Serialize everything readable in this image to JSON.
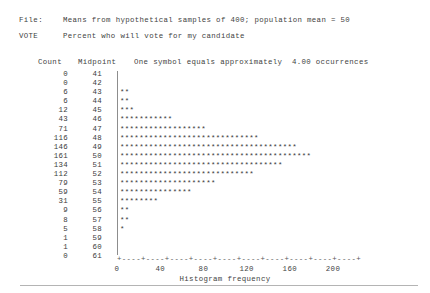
{
  "header": {
    "file_label": "File:",
    "file_value": "Means from hypothetical samples of 400; population mean = 50",
    "variable_label": "VOTE",
    "variable_value": "Percent who will vote for my candidate",
    "count_column_header": "Count",
    "midpoint_column_header": "Midpoint",
    "symbol_legend": "One symbol equals approximately  4.00 occurrences"
  },
  "axis": {
    "line": "+----+----+----+----+----+----+----+----+----+----+",
    "title": "Histogram frequency",
    "tick_labels": [
      "0",
      "40",
      "80",
      "120",
      "160",
      "200"
    ],
    "min": 0,
    "max": 200
  },
  "chart_data": {
    "type": "bar",
    "orientation": "horizontal",
    "title": "Means from hypothetical samples of 400; population mean = 50",
    "subtitle": "Percent who will vote for my candidate",
    "xlabel": "Histogram frequency",
    "ylabel": "Midpoint",
    "xlim": [
      0,
      200
    ],
    "symbol_scale": 4.0,
    "symbol_char": "*",
    "grid": false,
    "legend": "none",
    "categories": [
      41,
      42,
      43,
      44,
      45,
      46,
      47,
      48,
      49,
      50,
      51,
      52,
      53,
      54,
      55,
      56,
      57,
      58,
      59,
      60,
      61
    ],
    "values": [
      0,
      0,
      6,
      6,
      12,
      43,
      71,
      116,
      146,
      161,
      134,
      112,
      79,
      59,
      31,
      9,
      8,
      5,
      1,
      1,
      0
    ],
    "symbols": [
      0,
      0,
      2,
      2,
      3,
      11,
      18,
      29,
      37,
      40,
      34,
      28,
      20,
      15,
      8,
      2,
      2,
      1,
      0,
      0,
      0
    ]
  },
  "rows": [
    {
      "count": "0",
      "midpoint": "41",
      "bar": ""
    },
    {
      "count": "0",
      "midpoint": "42",
      "bar": ""
    },
    {
      "count": "6",
      "midpoint": "43",
      "bar": "**"
    },
    {
      "count": "6",
      "midpoint": "44",
      "bar": "**"
    },
    {
      "count": "12",
      "midpoint": "45",
      "bar": "***"
    },
    {
      "count": "43",
      "midpoint": "46",
      "bar": "***********"
    },
    {
      "count": "71",
      "midpoint": "47",
      "bar": "******************"
    },
    {
      "count": "116",
      "midpoint": "48",
      "bar": "*****************************"
    },
    {
      "count": "146",
      "midpoint": "49",
      "bar": "*************************************"
    },
    {
      "count": "161",
      "midpoint": "50",
      "bar": "****************************************"
    },
    {
      "count": "134",
      "midpoint": "51",
      "bar": "**********************************"
    },
    {
      "count": "112",
      "midpoint": "52",
      "bar": "****************************"
    },
    {
      "count": "79",
      "midpoint": "53",
      "bar": "********************"
    },
    {
      "count": "59",
      "midpoint": "54",
      "bar": "***************"
    },
    {
      "count": "31",
      "midpoint": "55",
      "bar": "********"
    },
    {
      "count": "9",
      "midpoint": "56",
      "bar": "**"
    },
    {
      "count": "8",
      "midpoint": "57",
      "bar": "**"
    },
    {
      "count": "5",
      "midpoint": "58",
      "bar": "*"
    },
    {
      "count": "1",
      "midpoint": "59",
      "bar": ""
    },
    {
      "count": "1",
      "midpoint": "60",
      "bar": ""
    },
    {
      "count": "0",
      "midpoint": "61",
      "bar": ""
    }
  ]
}
